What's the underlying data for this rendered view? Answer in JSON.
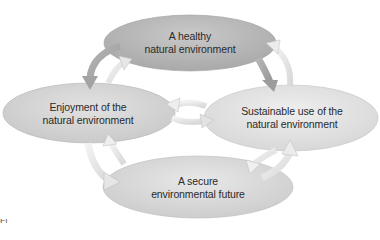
{
  "diagram": {
    "nodes": {
      "top": {
        "line1": "A healthy",
        "line2": "natural environment",
        "fill": "#b9b9b9"
      },
      "left": {
        "line1": "Enjoyment of the",
        "line2": "natural environment",
        "fill": "#d7d7d7"
      },
      "right": {
        "line1": "Sustainable use of the",
        "line2": "natural environment",
        "fill": "#e6e6e6"
      },
      "bottom": {
        "line1": "A secure",
        "line2": "environmental future",
        "fill": "#dddddd"
      }
    },
    "arrows": [
      {
        "from": "top",
        "to": "left",
        "style": "dark"
      },
      {
        "from": "left",
        "to": "top",
        "style": "light"
      },
      {
        "from": "top",
        "to": "right",
        "style": "dark"
      },
      {
        "from": "right",
        "to": "top",
        "style": "light"
      },
      {
        "from": "left",
        "to": "right",
        "style": "light"
      },
      {
        "from": "right",
        "to": "left",
        "style": "light"
      },
      {
        "from": "left",
        "to": "bottom",
        "style": "light"
      },
      {
        "from": "bottom",
        "to": "left",
        "style": "light"
      },
      {
        "from": "bottom",
        "to": "right",
        "style": "light"
      },
      {
        "from": "right",
        "to": "bottom",
        "style": "light"
      }
    ],
    "caption": "Fi"
  }
}
